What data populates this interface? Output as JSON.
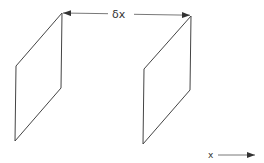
{
  "diagram": {
    "separation_label": "δx",
    "axis_label": "x",
    "stroke_color": "#444444",
    "planes": [
      {
        "name": "plane-left",
        "points": "62,13 61,88 15,141 16,66"
      },
      {
        "name": "plane-right",
        "points": "191,16 190,90 143,144 144,69"
      }
    ]
  }
}
